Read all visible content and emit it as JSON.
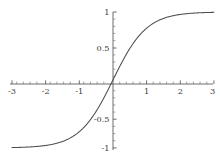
{
  "chart_data": {
    "type": "line",
    "title": "",
    "subtitle": "",
    "xlabel": "",
    "ylabel": "",
    "function": "tanh(x)",
    "xlim": [
      -3,
      3
    ],
    "ylim": [
      -1,
      1
    ],
    "grid": false,
    "legend": null,
    "axes_cross_at_origin": true,
    "x_major_ticks": [
      -3,
      -2,
      -1,
      1,
      2,
      3
    ],
    "x_tick_labels": [
      "-3",
      "-2",
      "-1",
      "1",
      "2",
      "3"
    ],
    "x_minor_tick_step": 0.2,
    "y_major_ticks": [
      -1,
      -0.5,
      0.5,
      1
    ],
    "y_tick_labels": [
      "-1",
      "-0.5",
      "0.5",
      "1"
    ],
    "y_minor_tick_step": 0.1,
    "curve_color": "#4d4d4d",
    "axis_color": "#4a4a4a",
    "background_color": "#ffffff",
    "series": [
      {
        "name": "tanh(x)",
        "x": [
          -3,
          -2.8,
          -2.6,
          -2.4,
          -2.2,
          -2,
          -1.8,
          -1.6,
          -1.4,
          -1.2,
          -1,
          -0.8,
          -0.6,
          -0.4,
          -0.2,
          0,
          0.2,
          0.4,
          0.6,
          0.8,
          1,
          1.2,
          1.4,
          1.6,
          1.8,
          2,
          2.2,
          2.4,
          2.6,
          2.8,
          3
        ],
        "values": [
          -0.995,
          -0.9926,
          -0.989,
          -0.9837,
          -0.9757,
          -0.964,
          -0.9468,
          -0.9217,
          -0.8854,
          -0.8337,
          -0.7616,
          -0.664,
          -0.5371,
          -0.3799,
          -0.1974,
          0,
          0.1974,
          0.3799,
          0.5371,
          0.664,
          0.7616,
          0.8337,
          0.8854,
          0.9217,
          0.9468,
          0.964,
          0.9757,
          0.9837,
          0.989,
          0.9926,
          0.995
        ]
      }
    ]
  },
  "labels": {
    "x": {
      "n3": "-3",
      "n2": "-2",
      "n1": "-1",
      "p1": "1",
      "p2": "2",
      "p3": "3"
    },
    "y": {
      "p1": "1",
      "p05": "0.5",
      "n05": "-0.5",
      "n1": "-1"
    }
  }
}
